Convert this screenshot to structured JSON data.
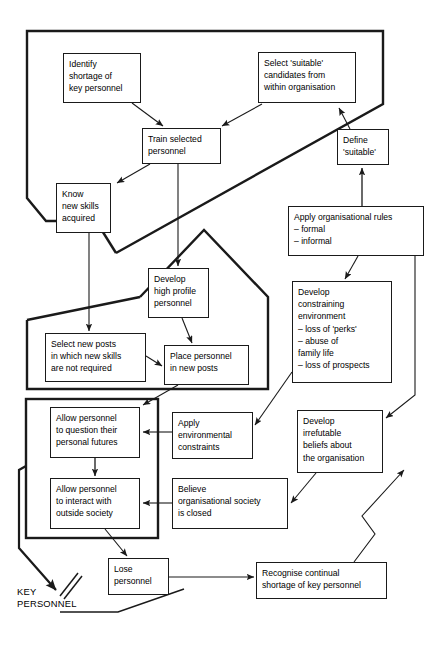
{
  "diagram": {
    "style": {
      "line_color": "#1a1a1a",
      "box_fill": "#ffffff",
      "page_background": "#ffffff"
    },
    "nodes": [
      {
        "id": "identify-shortage",
        "label": "Identify\nshortage of\nkey personnel",
        "x": 63,
        "y": 53,
        "w": 78,
        "h": 50
      },
      {
        "id": "select-candidates",
        "label": "Select 'suitable'\ncandidates from\nwithin organisation",
        "x": 258,
        "y": 52,
        "w": 98,
        "h": 51
      },
      {
        "id": "train-personnel",
        "label": "Train selected\npersonnel",
        "x": 142,
        "y": 128,
        "w": 79,
        "h": 36
      },
      {
        "id": "define-suitable",
        "label": "Define\n'suitable'",
        "x": 337,
        "y": 129,
        "w": 52,
        "h": 36
      },
      {
        "id": "know-new-skills",
        "label": "Know\nnew skills\nacquired",
        "x": 56,
        "y": 183,
        "w": 55,
        "h": 50
      },
      {
        "id": "apply-org-rules",
        "label": "Apply organisational rules\n– formal\n– informal",
        "x": 288,
        "y": 206,
        "w": 136,
        "h": 50
      },
      {
        "id": "develop-high-profile",
        "label": "Develop\nhigh profile\npersonnel",
        "x": 148,
        "y": 268,
        "w": 61,
        "h": 50
      },
      {
        "id": "develop-constraining",
        "label": "Develop\nconstraining\nenvironment\n– loss of 'perks'\n– abuse of\nfamily life\n– loss of prospects",
        "x": 292,
        "y": 281,
        "w": 100,
        "h": 102
      },
      {
        "id": "select-new-posts",
        "label": "Select new posts\nin which new skills\nare not required",
        "x": 45,
        "y": 333,
        "w": 101,
        "h": 49
      },
      {
        "id": "place-personnel",
        "label": "Place personnel\nin new posts",
        "x": 164,
        "y": 345,
        "w": 85,
        "h": 40
      },
      {
        "id": "allow-question",
        "label": "Allow personnel\nto question their\npersonal futures",
        "x": 50,
        "y": 407,
        "w": 90,
        "h": 51
      },
      {
        "id": "apply-env-constraints",
        "label": "Apply\nenvironmental\nconstraints",
        "x": 172,
        "y": 412,
        "w": 81,
        "h": 47
      },
      {
        "id": "develop-irrefutable",
        "label": "Develop\nirrefutable\nbeliefs about\nthe organisation",
        "x": 297,
        "y": 410,
        "w": 86,
        "h": 63
      },
      {
        "id": "allow-interact",
        "label": "Allow personnel\nto interact with\noutside society",
        "x": 50,
        "y": 478,
        "w": 90,
        "h": 51
      },
      {
        "id": "believe-closed",
        "label": "Believe\norganisational society\nis closed",
        "x": 172,
        "y": 478,
        "w": 116,
        "h": 51
      },
      {
        "id": "lose-personnel",
        "label": "Lose\npersonnel",
        "x": 108,
        "y": 558,
        "w": 61,
        "h": 37
      },
      {
        "id": "recognise-shortage",
        "label": "Recognise continual\nshortage of key personnel",
        "x": 256,
        "y": 562,
        "w": 131,
        "h": 37
      }
    ],
    "labels": [
      {
        "id": "key-personnel-label",
        "text": "KEY\nPERSONNEL",
        "x": 17,
        "y": 586
      }
    ],
    "edges": [
      {
        "from": "identify-shortage",
        "to": "train-personnel"
      },
      {
        "from": "select-candidates",
        "to": "train-personnel"
      },
      {
        "from": "train-personnel",
        "to": "know-new-skills"
      },
      {
        "from": "train-personnel",
        "to": "develop-high-profile"
      },
      {
        "from": "apply-org-rules",
        "to": "define-suitable"
      },
      {
        "from": "apply-org-rules",
        "to": "develop-constraining"
      },
      {
        "from": "know-new-skills",
        "to": "select-new-posts"
      },
      {
        "from": "develop-high-profile",
        "to": "place-personnel"
      },
      {
        "from": "select-new-posts",
        "to": "place-personnel"
      },
      {
        "from": "place-personnel",
        "to": "allow-question"
      },
      {
        "from": "apply-env-constraints",
        "to": "allow-question"
      },
      {
        "from": "believe-closed",
        "to": "allow-interact"
      },
      {
        "from": "allow-question",
        "to": "allow-interact"
      },
      {
        "from": "allow-interact",
        "to": "lose-personnel"
      },
      {
        "from": "lose-personnel",
        "to": "recognise-shortage"
      },
      {
        "from": "recognise-shortage",
        "to": "select-candidates"
      },
      {
        "from": "develop-constraining",
        "to": "apply-env-constraints"
      },
      {
        "from": "develop-irrefutable",
        "to": "believe-closed"
      },
      {
        "from": "apply-org-rules",
        "to": "develop-irrefutable"
      },
      {
        "from": "lose-personnel",
        "to": "key-personnel-label"
      }
    ]
  }
}
